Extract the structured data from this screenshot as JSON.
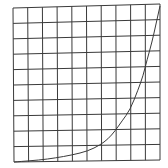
{
  "diagram": {
    "type": "grid-with-curve",
    "grid": {
      "columns": 10,
      "rows": 10,
      "corners": {
        "top_left": [
          13,
          8
        ],
        "top_right": [
          160,
          4
        ],
        "bottom_left": [
          14,
          162
        ],
        "bottom_right": [
          160,
          160
        ]
      },
      "line_color": "#3a3a3a",
      "line_width": 1
    },
    "curve": {
      "description": "exponential growth curve",
      "color": "#3a3a3a",
      "line_width": 1,
      "points": [
        [
          14,
          162
        ],
        [
          40,
          160
        ],
        [
          55,
          158
        ],
        [
          72,
          155
        ],
        [
          88,
          151
        ],
        [
          100,
          145
        ],
        [
          108,
          139
        ],
        [
          115,
          131
        ],
        [
          122,
          121
        ],
        [
          130,
          110
        ],
        [
          138,
          90
        ],
        [
          143,
          76
        ],
        [
          147,
          60
        ],
        [
          152,
          42
        ],
        [
          156,
          24
        ],
        [
          160,
          6
        ]
      ]
    }
  }
}
